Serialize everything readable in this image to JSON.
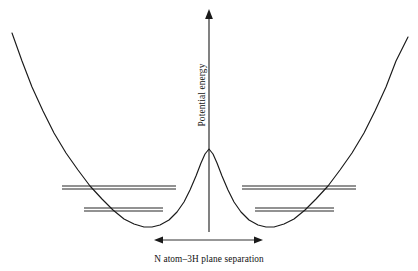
{
  "figure": {
    "name": "ammonia-inversion-double-well-potential",
    "background_color": "#ffffff",
    "stroke_color": "#1a1a1a",
    "width": 418,
    "height": 271
  },
  "axes": {
    "y_axis": {
      "label": "Potential energy",
      "orientation": "vertical",
      "rotation_deg": -90,
      "arrowhead": "up",
      "x": 209,
      "top_y": 10,
      "bottom_y": 232
    },
    "x_measure": {
      "label": "N atom–3H plane separation",
      "orientation": "horizontal",
      "arrowheads": "both",
      "y": 240,
      "left_x": 155,
      "right_x": 262
    }
  },
  "icons": {
    "up_arrowhead": "arrow-up-icon",
    "left_arrowhead": "arrow-left-icon",
    "right_arrowhead": "arrow-right-icon"
  },
  "chart_data": {
    "type": "line",
    "title": "",
    "subtitle": "",
    "xlabel": "N atom–3H plane separation",
    "ylabel": "Potential energy",
    "grid": false,
    "legend": "none",
    "axis_ticks": "none",
    "xlim": [
      0,
      418
    ],
    "ylim": [
      271,
      0
    ],
    "series": [
      {
        "name": "potential-energy-curve",
        "note": "Symmetric double-well curve in screen pixel coordinates (y increases downward).",
        "points": [
          [
            12,
            33
          ],
          [
            22,
            61
          ],
          [
            32,
            87
          ],
          [
            43,
            111
          ],
          [
            54,
            133
          ],
          [
            66,
            153
          ],
          [
            78,
            170
          ],
          [
            90,
            186
          ],
          [
            102,
            199
          ],
          [
            113,
            210
          ],
          [
            124,
            219
          ],
          [
            134,
            224
          ],
          [
            144,
            227
          ],
          [
            152,
            227
          ],
          [
            160,
            225
          ],
          [
            169,
            220
          ],
          [
            177,
            212
          ],
          [
            184,
            202
          ],
          [
            190,
            190
          ],
          [
            196,
            176
          ],
          [
            201,
            163
          ],
          [
            205,
            154
          ],
          [
            209,
            149
          ],
          [
            213,
            154
          ],
          [
            217,
            163
          ],
          [
            222,
            176
          ],
          [
            228,
            190
          ],
          [
            234,
            202
          ],
          [
            241,
            212
          ],
          [
            249,
            220
          ],
          [
            258,
            225
          ],
          [
            266,
            227
          ],
          [
            274,
            227
          ],
          [
            284,
            224
          ],
          [
            294,
            219
          ],
          [
            305,
            210
          ],
          [
            316,
            199
          ],
          [
            328,
            186
          ],
          [
            340,
            170
          ],
          [
            352,
            153
          ],
          [
            364,
            133
          ],
          [
            375,
            111
          ],
          [
            386,
            87
          ],
          [
            396,
            61
          ],
          [
            408,
            37
          ]
        ]
      }
    ],
    "energy_levels": [
      {
        "name": "left-well-upper-doublet",
        "well": "left",
        "kind": "doublet",
        "y_values": [
          186,
          189
        ],
        "x_start": 62,
        "x_end": 176
      },
      {
        "name": "left-well-lower-doublet",
        "well": "left",
        "kind": "doublet",
        "y_values": [
          208,
          211
        ],
        "x_start": 84,
        "x_end": 163
      },
      {
        "name": "right-well-upper-doublet",
        "well": "right",
        "kind": "doublet",
        "y_values": [
          186,
          189
        ],
        "x_start": 242,
        "x_end": 356
      },
      {
        "name": "right-well-lower-doublet",
        "well": "right",
        "kind": "doublet",
        "y_values": [
          208,
          211
        ],
        "x_start": 255,
        "x_end": 334
      }
    ],
    "features": {
      "barrier_peak": {
        "x": 209,
        "y": 149
      },
      "left_minimum": {
        "x": 148,
        "y": 227
      },
      "right_minimum": {
        "x": 270,
        "y": 227
      },
      "symmetry": "mirror about x = 209"
    }
  }
}
